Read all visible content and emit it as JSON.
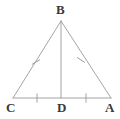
{
  "figure": {
    "kind": "geometry-diagram",
    "shape": "isosceles-triangle-with-altitude",
    "background_color": "#ffffff",
    "stroke_color": "#9a9a9a",
    "label_color": "#3a3a3a",
    "stroke_width": 0.9
  },
  "labels": {
    "apex": "B",
    "left_base": "C",
    "midpoint": "D",
    "right_base": "A"
  },
  "points": {
    "B": {
      "x": 61,
      "y": 21
    },
    "C": {
      "x": 13,
      "y": 98
    },
    "D": {
      "x": 61,
      "y": 98
    },
    "A": {
      "x": 111,
      "y": 98
    }
  },
  "segments": [
    {
      "name": "CB",
      "from": "C",
      "to": "B",
      "ticks": 1
    },
    {
      "name": "BA",
      "from": "B",
      "to": "A",
      "ticks": 1
    },
    {
      "name": "CA",
      "from": "C",
      "to": "A",
      "ticks": 0
    },
    {
      "name": "BD",
      "from": "B",
      "to": "D",
      "ticks": 0
    },
    {
      "name": "CD",
      "from": "C",
      "to": "D",
      "ticks": 1
    },
    {
      "name": "DA",
      "from": "D",
      "to": "A",
      "ticks": 1
    }
  ],
  "tick_marks": [
    {
      "on": "CB",
      "x": 36,
      "y": 62,
      "angle": 58
    },
    {
      "on": "BA",
      "x": 81,
      "y": 60,
      "angle": -57
    },
    {
      "on": "CD",
      "x": 37,
      "y": 98,
      "angle": 0
    },
    {
      "on": "DA",
      "x": 86,
      "y": 98,
      "angle": 0
    }
  ]
}
